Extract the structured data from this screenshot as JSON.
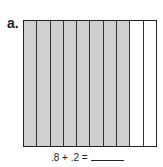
{
  "problem": {
    "label": "a.",
    "grid": {
      "columns": 10,
      "shaded_columns": 8,
      "shade_color": "#d0d0d0",
      "border_color": "#222222"
    },
    "equation": ".8 + .2 ="
  }
}
